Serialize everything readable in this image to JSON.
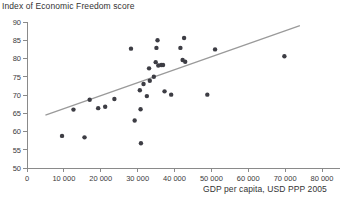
{
  "chart_data": {
    "type": "scatter",
    "title": "Index of Economic Freedom score",
    "xlabel": "GDP per capita, USD PPP 2005",
    "ylabel": "Index of Economic Freedom score",
    "xlim": [
      0,
      80000
    ],
    "ylim": [
      50,
      90
    ],
    "grid": false,
    "legend": false,
    "xticks": [
      0,
      10000,
      20000,
      30000,
      40000,
      50000,
      60000,
      70000,
      80000
    ],
    "xticklabels": [
      "0",
      "10 000",
      "20 000",
      "30 000",
      "40 000",
      "50 000",
      "60 000",
      "70 000",
      "80 000"
    ],
    "yticks": [
      50,
      55,
      60,
      65,
      70,
      75,
      80,
      85,
      90
    ],
    "yticklabels": [
      "50",
      "55",
      "60",
      "65",
      "70",
      "75",
      "80",
      "85",
      "90"
    ],
    "point_color": "#3d3d44",
    "trendline_color": "#9a9a9a",
    "axis_color": "#8a8a8a",
    "series": [
      {
        "name": "Countries",
        "points": [
          {
            "x": 9500,
            "y": 58.8
          },
          {
            "x": 12600,
            "y": 66.0
          },
          {
            "x": 15600,
            "y": 58.4
          },
          {
            "x": 17000,
            "y": 68.7
          },
          {
            "x": 19300,
            "y": 66.4
          },
          {
            "x": 21200,
            "y": 66.8
          },
          {
            "x": 23700,
            "y": 68.9
          },
          {
            "x": 29200,
            "y": 63.0
          },
          {
            "x": 28200,
            "y": 82.7
          },
          {
            "x": 30800,
            "y": 66.1
          },
          {
            "x": 30900,
            "y": 56.8
          },
          {
            "x": 30600,
            "y": 71.3
          },
          {
            "x": 31600,
            "y": 73.0
          },
          {
            "x": 32500,
            "y": 69.7
          },
          {
            "x": 33100,
            "y": 77.3
          },
          {
            "x": 33300,
            "y": 73.9
          },
          {
            "x": 34400,
            "y": 75.0
          },
          {
            "x": 34900,
            "y": 79.0
          },
          {
            "x": 35100,
            "y": 82.9
          },
          {
            "x": 35400,
            "y": 85.0
          },
          {
            "x": 35600,
            "y": 78.1
          },
          {
            "x": 36400,
            "y": 78.2
          },
          {
            "x": 36900,
            "y": 78.2
          },
          {
            "x": 37300,
            "y": 71.0
          },
          {
            "x": 39100,
            "y": 70.1
          },
          {
            "x": 41600,
            "y": 82.9
          },
          {
            "x": 42200,
            "y": 79.6
          },
          {
            "x": 42600,
            "y": 85.6
          },
          {
            "x": 42900,
            "y": 79.1
          },
          {
            "x": 48900,
            "y": 70.1
          },
          {
            "x": 51000,
            "y": 82.5
          },
          {
            "x": 69800,
            "y": 80.6
          }
        ]
      }
    ],
    "trendline": {
      "x0": 5000,
      "y0": 64.5,
      "x1": 74000,
      "y1": 89.0
    }
  },
  "caption": ""
}
